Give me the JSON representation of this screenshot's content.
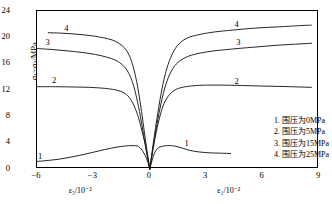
{
  "chart_data": {
    "type": "line",
    "title": "",
    "xlabel_left": "ε₃/10⁻²",
    "xlabel_right": "ε₁/10⁻²",
    "ylabel": "σ₁−σ₃/MPa",
    "xlim": [
      -6,
      9
    ],
    "ylim": [
      0,
      24
    ],
    "xticks": [
      -6,
      -3,
      0,
      3,
      6,
      9
    ],
    "yticks": [
      0,
      4,
      8,
      12,
      16,
      20,
      24
    ],
    "grid": false,
    "legend_position": "inside-bottom-right",
    "series": [
      {
        "name": "1",
        "legend": "1. 围压为0MPa",
        "confining_pressure_MPa": 0,
        "lateral_branch": [
          [
            -6.0,
            1.15
          ],
          [
            -5.4,
            1.3
          ],
          [
            -4.8,
            1.5
          ],
          [
            -4.2,
            1.8
          ],
          [
            -3.6,
            2.15
          ],
          [
            -3.0,
            2.55
          ],
          [
            -2.4,
            2.95
          ],
          [
            -1.8,
            3.3
          ],
          [
            -1.3,
            3.5
          ],
          [
            -0.9,
            3.55
          ],
          [
            -0.6,
            3.4
          ],
          [
            -0.35,
            2.6
          ],
          [
            -0.15,
            1.4
          ],
          [
            0.0,
            0.0
          ]
        ],
        "axial_branch": [
          [
            0.0,
            0.0
          ],
          [
            0.12,
            1.3
          ],
          [
            0.25,
            2.4
          ],
          [
            0.4,
            3.1
          ],
          [
            0.6,
            3.4
          ],
          [
            0.9,
            3.55
          ],
          [
            1.3,
            3.5
          ],
          [
            1.7,
            3.2
          ],
          [
            2.1,
            2.85
          ],
          [
            2.6,
            2.6
          ],
          [
            3.2,
            2.45
          ],
          [
            3.8,
            2.4
          ],
          [
            4.3,
            2.35
          ]
        ]
      },
      {
        "name": "2",
        "legend": "2. 围压为5MPa",
        "confining_pressure_MPa": 5,
        "lateral_branch": [
          [
            -6.0,
            12.5
          ],
          [
            -5.0,
            12.5
          ],
          [
            -4.0,
            12.45
          ],
          [
            -3.2,
            12.4
          ],
          [
            -2.4,
            12.25
          ],
          [
            -1.8,
            12.0
          ],
          [
            -1.4,
            11.6
          ],
          [
            -1.1,
            10.9
          ],
          [
            -0.85,
            9.7
          ],
          [
            -0.6,
            7.8
          ],
          [
            -0.4,
            5.6
          ],
          [
            -0.22,
            3.4
          ],
          [
            -0.1,
            1.5
          ],
          [
            0.0,
            0.0
          ]
        ],
        "axial_branch": [
          [
            0.0,
            0.0
          ],
          [
            0.15,
            2.6
          ],
          [
            0.3,
            5.0
          ],
          [
            0.5,
            7.6
          ],
          [
            0.75,
            9.9
          ],
          [
            1.05,
            11.3
          ],
          [
            1.4,
            12.1
          ],
          [
            1.9,
            12.5
          ],
          [
            2.6,
            12.7
          ],
          [
            3.5,
            12.75
          ],
          [
            4.6,
            12.7
          ],
          [
            6.0,
            12.6
          ],
          [
            7.5,
            12.5
          ],
          [
            8.6,
            12.4
          ]
        ]
      },
      {
        "name": "3",
        "legend": "3. 围压为15MPa",
        "confining_pressure_MPa": 15,
        "lateral_branch": [
          [
            -6.0,
            18.3
          ],
          [
            -5.2,
            18.15
          ],
          [
            -4.4,
            17.95
          ],
          [
            -3.6,
            17.7
          ],
          [
            -2.9,
            17.4
          ],
          [
            -2.3,
            17.0
          ],
          [
            -1.8,
            16.5
          ],
          [
            -1.45,
            15.8
          ],
          [
            -1.15,
            14.7
          ],
          [
            -0.9,
            13.0
          ],
          [
            -0.7,
            10.8
          ],
          [
            -0.5,
            8.0
          ],
          [
            -0.33,
            5.2
          ],
          [
            -0.18,
            2.7
          ],
          [
            0.0,
            0.0
          ]
        ],
        "axial_branch": [
          [
            0.0,
            0.0
          ],
          [
            0.18,
            3.4
          ],
          [
            0.38,
            6.8
          ],
          [
            0.6,
            10.0
          ],
          [
            0.85,
            12.8
          ],
          [
            1.15,
            14.9
          ],
          [
            1.5,
            16.2
          ],
          [
            1.95,
            17.0
          ],
          [
            2.5,
            17.5
          ],
          [
            3.3,
            17.9
          ],
          [
            4.3,
            18.2
          ],
          [
            5.5,
            18.5
          ],
          [
            6.8,
            18.8
          ],
          [
            8.0,
            19.0
          ],
          [
            8.6,
            19.1
          ]
        ]
      },
      {
        "name": "4",
        "legend": "4. 围压为25MPa",
        "confining_pressure_MPa": 25,
        "lateral_branch": [
          [
            -5.4,
            20.7
          ],
          [
            -4.8,
            20.65
          ],
          [
            -4.2,
            20.55
          ],
          [
            -3.6,
            20.4
          ],
          [
            -3.0,
            20.2
          ],
          [
            -2.5,
            19.95
          ],
          [
            -2.0,
            19.6
          ],
          [
            -1.65,
            19.1
          ],
          [
            -1.35,
            18.4
          ],
          [
            -1.1,
            17.3
          ],
          [
            -0.9,
            15.7
          ],
          [
            -0.7,
            13.3
          ],
          [
            -0.52,
            10.3
          ],
          [
            -0.36,
            7.1
          ],
          [
            -0.2,
            3.8
          ],
          [
            0.0,
            0.0
          ]
        ],
        "axial_branch": [
          [
            0.0,
            0.0
          ],
          [
            0.2,
            4.2
          ],
          [
            0.42,
            8.4
          ],
          [
            0.65,
            12.2
          ],
          [
            0.9,
            15.2
          ],
          [
            1.2,
            17.5
          ],
          [
            1.55,
            19.0
          ],
          [
            2.0,
            19.9
          ],
          [
            2.6,
            20.4
          ],
          [
            3.4,
            20.8
          ],
          [
            4.4,
            21.1
          ],
          [
            5.6,
            21.4
          ],
          [
            6.9,
            21.6
          ],
          [
            8.1,
            21.8
          ],
          [
            8.6,
            21.85
          ]
        ]
      }
    ],
    "curve_number_labels": [
      {
        "text": "4",
        "x": -4.55,
        "y": 22.1
      },
      {
        "text": "3",
        "x": -5.55,
        "y": 19.9
      },
      {
        "text": "2",
        "x": -5.2,
        "y": 14.2
      },
      {
        "text": "1",
        "x": -5.95,
        "y": 2.6
      },
      {
        "text": "4",
        "x": 4.5,
        "y": 22.6
      },
      {
        "text": "3",
        "x": 4.6,
        "y": 19.9
      },
      {
        "text": "2",
        "x": 4.5,
        "y": 14.0
      },
      {
        "text": "1",
        "x": 1.85,
        "y": 4.6
      }
    ]
  },
  "axes": {
    "ylabel_text": "σ₁−σ₃/MPa",
    "yticks": [
      "0",
      "4",
      "8",
      "12",
      "16",
      "20",
      "24"
    ],
    "xticks": [
      "−6",
      "−3",
      "0",
      "3",
      "6",
      "9"
    ],
    "xlabel_left": "ε₃/10⁻²",
    "xlabel_right": "ε₁/10⁻²"
  },
  "legend": {
    "items": [
      "1. 围压为0MPa",
      "2. 围压为5MPa",
      "3. 围压为15MPa",
      "4. 围压为25MPa"
    ]
  },
  "colors": {
    "axis": "#000000",
    "curve": "#1a1a1a",
    "background": "#ffffff"
  }
}
